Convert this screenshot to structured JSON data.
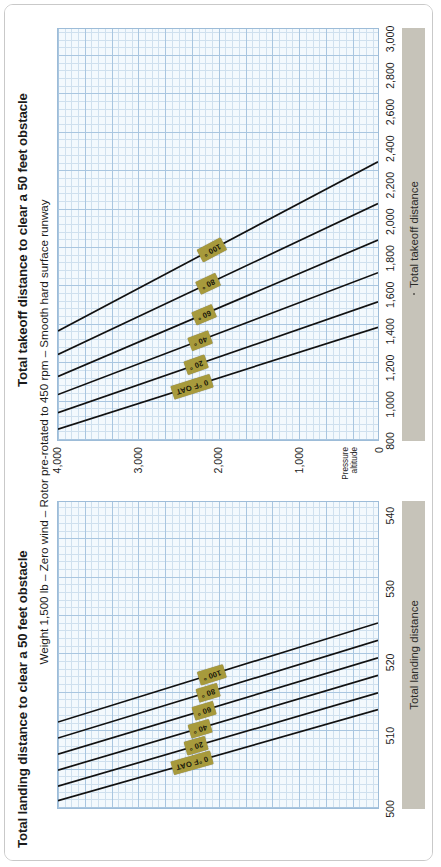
{
  "page": {
    "orientation": "rotated-90-ccw",
    "background": "#ffffff",
    "border_color": "#c9c9c9"
  },
  "colors": {
    "grid_minor": "#cfe0ee",
    "grid_major": "#a9c6e0",
    "plot_background": "#f3f9fd",
    "curve": "#111111",
    "tag_fill": "#a79a3c",
    "axis_bar_fill": "#c6c3b9"
  },
  "shared": {
    "subtitle": "Weight 1,500 lb – Zero wind – Rotor pre-rotated to 450 rpm – Smooth hard surface runway",
    "y_axis_caption_line1": "Pressure",
    "y_axis_caption_line2": "altitude",
    "y_ticks": [
      "4,000",
      "3,000",
      "2,000",
      "1,000",
      "0"
    ],
    "oat_labels": [
      "0 °F OAT",
      "20 °",
      "40 °",
      "60 °",
      "80 °",
      "100 °"
    ]
  },
  "charts": [
    {
      "id": "landing",
      "title": "Total landing distance to clear a 50 feet obstacle",
      "axis_bar_label": "Total landing distance",
      "x_ticks": [
        "500",
        "510",
        "520",
        "530",
        "540"
      ]
    },
    {
      "id": "takeoff",
      "title": "Total takeoff distance to clear a 50 feet obstacle",
      "axis_bar_label": "Total takeoff distance",
      "x_ticks": [
        "800",
        "1,000",
        "1,200",
        "1,400",
        "1,600",
        "1,800",
        "2,000",
        "2,200",
        "2,400",
        "2,600",
        "2,800",
        "3,000"
      ]
    }
  ],
  "chart_data": [
    {
      "id": "landing",
      "type": "line",
      "title": "Total landing distance to clear a 50 feet obstacle",
      "subtitle": "Weight 1,500 lb – Zero wind – Rotor pre-rotated to 450 rpm – Smooth hard surface runway",
      "xlabel": "Total landing distance",
      "ylabel": "Pressure altitude",
      "xlim": [
        500,
        542
      ],
      "ylim": [
        0,
        4000
      ],
      "xticks": [
        500,
        510,
        520,
        530,
        540
      ],
      "yticks": [
        0,
        1000,
        2000,
        3000,
        4000
      ],
      "grid": true,
      "legend": "inline-tags",
      "series": [
        {
          "name": "0 °F OAT",
          "points": [
            [
              501.0,
              4000
            ],
            [
              513.5,
              0
            ]
          ]
        },
        {
          "name": "20 °",
          "points": [
            [
              503.0,
              4000
            ],
            [
              515.8,
              0
            ]
          ]
        },
        {
          "name": "40 °",
          "points": [
            [
              505.2,
              4000
            ],
            [
              518.2,
              0
            ]
          ]
        },
        {
          "name": "60 °",
          "points": [
            [
              507.4,
              4000
            ],
            [
              520.6,
              0
            ]
          ]
        },
        {
          "name": "80 °",
          "points": [
            [
              509.6,
              4000
            ],
            [
              523.0,
              0
            ]
          ]
        },
        {
          "name": "100 °",
          "points": [
            [
              511.8,
              4000
            ],
            [
              525.4,
              0
            ]
          ]
        }
      ]
    },
    {
      "id": "takeoff",
      "type": "line",
      "title": "Total takeoff distance to clear a 50 feet obstacle",
      "subtitle": "Weight 1,500 lb – Zero wind – Rotor pre-rotated to 450 rpm – Smooth hard surface runway",
      "xlabel": "Total takeoff distance",
      "ylabel": "Pressure altitude",
      "xlim": [
        800,
        3060
      ],
      "ylim": [
        0,
        4000
      ],
      "xticks": [
        800,
        1000,
        1200,
        1400,
        1600,
        1800,
        2000,
        2200,
        2400,
        2600,
        2800,
        3000
      ],
      "yticks": [
        0,
        1000,
        2000,
        3000,
        4000
      ],
      "grid": true,
      "legend": "inline-tags",
      "series": [
        {
          "name": "0 °F OAT",
          "points": [
            [
              860,
              4000
            ],
            [
              1420,
              0
            ]
          ]
        },
        {
          "name": "20 °",
          "points": [
            [
              950,
              4000
            ],
            [
              1560,
              0
            ]
          ]
        },
        {
          "name": "40 °",
          "points": [
            [
              1050,
              4000
            ],
            [
              1720,
              0
            ]
          ]
        },
        {
          "name": "60 °",
          "points": [
            [
              1150,
              4000
            ],
            [
              1900,
              0
            ]
          ]
        },
        {
          "name": "80 °",
          "points": [
            [
              1270,
              4000
            ],
            [
              2100,
              0
            ]
          ]
        },
        {
          "name": "100 °",
          "points": [
            [
              1400,
              4000
            ],
            [
              2330,
              0
            ]
          ]
        }
      ]
    }
  ]
}
